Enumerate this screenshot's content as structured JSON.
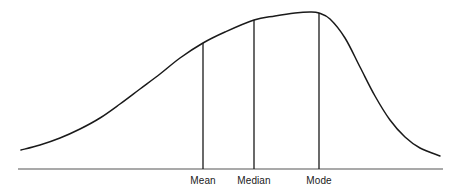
{
  "figure": {
    "title": "",
    "background_color": "#ffffff",
    "curve_color": "#1a1a1a",
    "axis_color": "#555555",
    "marker_color": "#1a1a1a"
  },
  "labels": {
    "mean": "Mean",
    "median": "Median",
    "mode": "Mode"
  },
  "chart_data": {
    "type": "line",
    "title": "",
    "subtitle": "",
    "xlabel": "",
    "ylabel": "",
    "grid": false,
    "legend": "none",
    "xlim": [
      0,
      454
    ],
    "ylim": [
      169,
      10
    ],
    "axis": {
      "baseline_y": 169,
      "x_start": 18,
      "x_end": 443
    },
    "annotations": [
      {
        "label": "Mean",
        "x": 203,
        "curve_y": 43,
        "baseline_y": 169
      },
      {
        "label": "Median",
        "x": 254,
        "curve_y": 20,
        "baseline_y": 169
      },
      {
        "label": "Mode",
        "x": 319,
        "curve_y": 13,
        "baseline_y": 169
      }
    ],
    "x": [
      21,
      40,
      60,
      80,
      100,
      120,
      140,
      160,
      180,
      203,
      225,
      254,
      275,
      295,
      310,
      319,
      330,
      345,
      360,
      375,
      390,
      405,
      420,
      440
    ],
    "y": [
      150,
      145,
      138,
      129,
      118,
      104,
      89,
      74,
      58,
      43,
      32,
      20,
      16,
      13,
      12,
      13,
      19,
      38,
      67,
      96,
      120,
      137,
      148,
      156
    ],
    "values_note": "y values are pixel rows measured from the top of the image; lower y = higher density. Peak (Mode) at x=319."
  }
}
